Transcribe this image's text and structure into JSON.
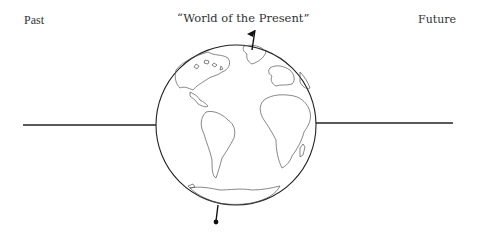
{
  "labels": {
    "past": "Past",
    "present": "“World of the Present”",
    "future": "Future"
  },
  "diagram": {
    "globe": {
      "cx": 236,
      "cy": 125,
      "r": 80
    },
    "left_line": {
      "x1": 23,
      "x2": 156,
      "y": 125
    },
    "right_line": {
      "x1": 316,
      "x2": 453,
      "y": 123
    },
    "markers": [
      "flag-top",
      "pin-bottom"
    ],
    "colors": {
      "stroke": "#222222",
      "land": "#555555",
      "text": "#333333"
    }
  }
}
